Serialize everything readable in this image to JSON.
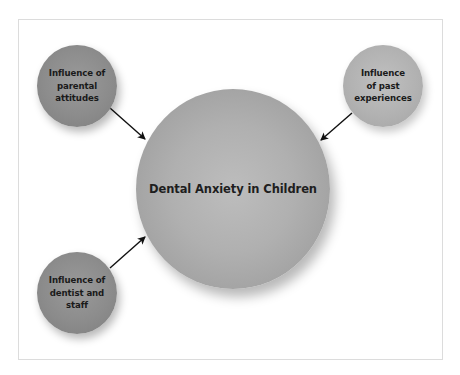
{
  "diagram": {
    "central_node": {
      "label": "Dental Anxiety in Children"
    },
    "influence_nodes": [
      {
        "id": "parental",
        "label": "Influence of\nparental\nattitudes",
        "position": "top-left"
      },
      {
        "id": "past",
        "label": "Influence\nof past\nexperiences",
        "position": "top-right"
      },
      {
        "id": "dentist",
        "label": "Influence of\ndentist and\nstaff",
        "position": "bottom-left"
      }
    ],
    "edges": [
      {
        "from": "parental",
        "to": "central"
      },
      {
        "from": "past",
        "to": "central"
      },
      {
        "from": "dentist",
        "to": "central"
      }
    ],
    "colors": {
      "dark_node": "#8c8c8c",
      "light_node": "#b2b2b2",
      "central_node": "#b0b0b0",
      "arrow": "#111111",
      "frame_border": "#dcdcdc"
    }
  }
}
